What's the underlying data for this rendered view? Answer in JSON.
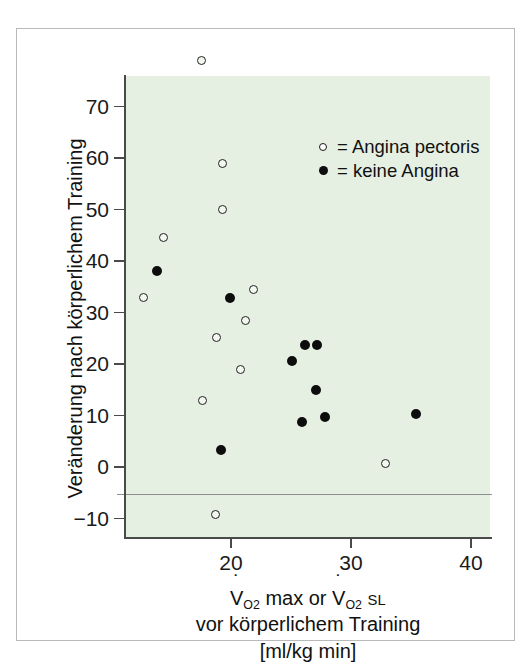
{
  "figure": {
    "background_color": "#ffffff",
    "plot_field_color": "#e5efe2",
    "frame_color": "#b9b9b9"
  },
  "legend": {
    "position": "top-right inside plot",
    "entries": [
      {
        "marker": "open-circle",
        "equals": "=",
        "label": "Angina pectoris"
      },
      {
        "marker": "filled-circle",
        "equals": "=",
        "label": "keine Angina"
      }
    ]
  },
  "axes": {
    "y_title": "Veränderung nach körperlichem Training",
    "x_title_line1_pre": "V",
    "x_title_line1_sub1": "O",
    "x_title_line1_sub1b": "2",
    "x_title_line1_mid": " max or ",
    "x_title_line1_pre2": "V",
    "x_title_line1_sub2": "O",
    "x_title_line1_sub2b": "2",
    "x_title_line1_sl": "SL",
    "x_title_line2": "vor körperlichem Training",
    "x_title_line3": "[ml/kg min]",
    "y_ticks": [
      70,
      60,
      50,
      40,
      30,
      20,
      10,
      0,
      -10
    ],
    "y_tick_labels": [
      "70",
      "60",
      "50",
      "40",
      "30",
      "20",
      "10",
      "0",
      "−10"
    ],
    "x_ticks": [
      20,
      30,
      40
    ],
    "x_tick_labels": [
      "20",
      "30",
      "40"
    ]
  },
  "chart_data": {
    "type": "scatter",
    "title": "",
    "xlabel": "V̇O2 max or V̇O2 SL vor körperlichem Training [ml/kg min]",
    "ylabel": "Veränderung nach körperlichem Training",
    "xlim": [
      11.0,
      42.0
    ],
    "ylim": [
      -12.0,
      81.0
    ],
    "grid": false,
    "zero_line": 0,
    "legend_position": "upper right",
    "series": [
      {
        "name": "Angina pectoris",
        "marker": "open-circle",
        "color": "#202020",
        "points": [
          {
            "x": 17.5,
            "y": 79.0
          },
          {
            "x": 19.3,
            "y": 59.0
          },
          {
            "x": 19.3,
            "y": 50.0
          },
          {
            "x": 14.4,
            "y": 44.5
          },
          {
            "x": 21.9,
            "y": 34.5
          },
          {
            "x": 12.7,
            "y": 33.0
          },
          {
            "x": 21.2,
            "y": 28.5
          },
          {
            "x": 18.8,
            "y": 25.2
          },
          {
            "x": 20.8,
            "y": 19.0
          },
          {
            "x": 17.6,
            "y": 13.0
          },
          {
            "x": 32.9,
            "y": 0.7
          },
          {
            "x": 18.7,
            "y": -9.2
          }
        ]
      },
      {
        "name": "keine Angina",
        "marker": "filled-circle",
        "color": "#0d0d0d",
        "points": [
          {
            "x": 13.8,
            "y": 38.0
          },
          {
            "x": 19.9,
            "y": 32.8
          },
          {
            "x": 26.2,
            "y": 23.7
          },
          {
            "x": 27.2,
            "y": 23.7
          },
          {
            "x": 25.1,
            "y": 20.6
          },
          {
            "x": 27.1,
            "y": 15.0
          },
          {
            "x": 27.8,
            "y": 9.8
          },
          {
            "x": 25.9,
            "y": 8.7
          },
          {
            "x": 35.4,
            "y": 10.2
          },
          {
            "x": 19.2,
            "y": 3.3
          }
        ]
      }
    ]
  }
}
